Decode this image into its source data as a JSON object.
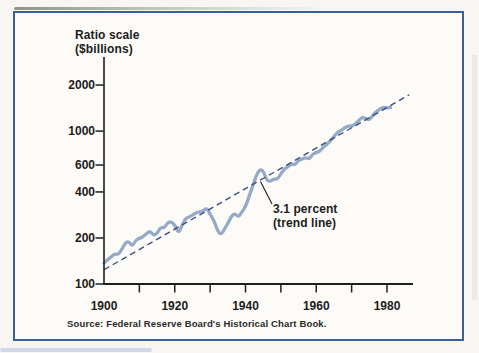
{
  "page": {
    "background": "#f7f6f2"
  },
  "chart_data": {
    "type": "line",
    "title": "",
    "ylabel": "Ratio scale ($billions)",
    "ylabel_lines": [
      "Ratio scale",
      "($billions)"
    ],
    "xlabel": "",
    "y_scale": "log",
    "ylim": [
      100,
      2900
    ],
    "xlim": [
      1900,
      1987
    ],
    "grid": false,
    "legend": "none",
    "y_ticks": [
      100,
      200,
      400,
      600,
      1000,
      2000
    ],
    "x_ticks": [
      1910,
      1920,
      1930,
      1940,
      1950,
      1960,
      1970,
      1980
    ],
    "x_tick_labels": [
      1900,
      1920,
      1940,
      1960,
      1980
    ],
    "annotation": {
      "text": "3.1 percent (trend line)",
      "lines": [
        "3.1 percent",
        "(trend line)"
      ]
    },
    "source": "Source: Federal Reserve Board's Historical Chart Book.",
    "series": [
      {
        "name": "",
        "x": [
          1900,
          1901,
          1902,
          1903,
          1904,
          1905,
          1906,
          1907,
          1908,
          1909,
          1910,
          1911,
          1912,
          1913,
          1914,
          1915,
          1916,
          1917,
          1918,
          1919,
          1920,
          1921,
          1922,
          1923,
          1924,
          1925,
          1926,
          1927,
          1928,
          1929,
          1930,
          1931,
          1932,
          1933,
          1934,
          1935,
          1936,
          1937,
          1938,
          1939,
          1940,
          1941,
          1942,
          1943,
          1944,
          1945,
          1946,
          1947,
          1948,
          1949,
          1950,
          1951,
          1952,
          1953,
          1954,
          1955,
          1956,
          1957,
          1958,
          1959,
          1960,
          1961,
          1962,
          1963,
          1964,
          1965,
          1966,
          1967,
          1968,
          1969,
          1970,
          1971,
          1972,
          1973,
          1974,
          1975,
          1976,
          1977,
          1978,
          1979,
          1980,
          1981
        ],
        "values": [
          137,
          144,
          150,
          158,
          155,
          168,
          186,
          190,
          176,
          194,
          199,
          203,
          214,
          222,
          208,
          213,
          235,
          232,
          252,
          256,
          244,
          214,
          240,
          268,
          274,
          282,
          293,
          296,
          300,
          315,
          285,
          263,
          226,
          209,
          227,
          249,
          277,
          290,
          273,
          296,
          320,
          374,
          432,
          510,
          561,
          551,
          477,
          468,
          487,
          483,
          525,
          565,
          585,
          610,
          601,
          644,
          657,
          672,
          655,
          709,
          723,
          740,
          785,
          818,
          866,
          921,
          981,
          1008,
          1052,
          1079,
          1075,
          1108,
          1171,
          1235,
          1210,
          1180,
          1273,
          1341,
          1400,
          1432,
          1418,
          1426
        ]
      }
    ],
    "trend": {
      "label": "3.1 percent (trend line)",
      "rate_percent": 3.1,
      "start_year": 1900,
      "start_value": 124,
      "end_year": 1986.3,
      "style": "dashed"
    },
    "colors": {
      "data_line": "#96aac7",
      "trend_line": "#39517f",
      "axis": "#1f1f1f",
      "text": "#1c1c1c",
      "frame_border": "#3c5f97"
    }
  }
}
